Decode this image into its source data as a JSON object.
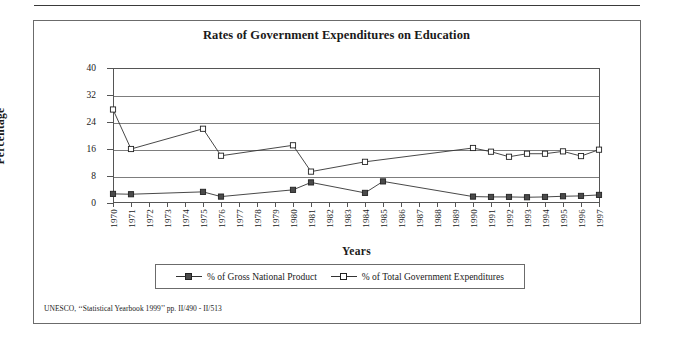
{
  "figure": {
    "title": "Rates of Government Expenditures on Education",
    "source_note": "UNESCO, ‘‘Statistical Yearbook 1999’’ pp. II/490 - II/513"
  },
  "legend": {
    "entries": [
      {
        "label": "% of Gross National Product",
        "marker": "filled-square",
        "color": "#4a4a4a"
      },
      {
        "label": "% of Total Government Expenditures",
        "marker": "open-square",
        "color": "#ffffff"
      }
    ]
  },
  "chart_data": {
    "type": "line",
    "title": "Rates of Government Expenditures on Education",
    "xlabel": "Years",
    "ylabel": "Percentage",
    "ylim": [
      0,
      40
    ],
    "yticks": [
      0,
      8,
      16,
      24,
      32,
      40
    ],
    "grid": true,
    "legend_position": "bottom",
    "categories": [
      "1970",
      "1971",
      "1972",
      "1973",
      "1974",
      "1975",
      "1976",
      "1977",
      "1978",
      "1979",
      "1980",
      "1981",
      "1982",
      "1983",
      "1984",
      "1985",
      "1986",
      "1987",
      "1988",
      "1989",
      "1990",
      "1991",
      "1992",
      "1993",
      "1994",
      "1995",
      "1996",
      "1997"
    ],
    "series": [
      {
        "name": "% of Gross National Product",
        "marker": "filled-square",
        "color": "#4a4a4a",
        "values": [
          2.7,
          2.6,
          null,
          null,
          null,
          3.3,
          1.9,
          null,
          null,
          null,
          3.9,
          6.1,
          null,
          null,
          3.0,
          6.4,
          null,
          null,
          null,
          null,
          1.9,
          1.8,
          1.8,
          1.7,
          1.8,
          2.0,
          2.1,
          2.4
        ]
      },
      {
        "name": "% of Total Government Expenditures",
        "marker": "open-square",
        "color": "#ffffff",
        "values": [
          27.7,
          16.0,
          null,
          null,
          null,
          22.0,
          14.0,
          null,
          null,
          null,
          17.1,
          9.3,
          null,
          null,
          12.2,
          null,
          null,
          null,
          null,
          null,
          16.3,
          15.2,
          13.7,
          14.6,
          14.6,
          15.3,
          13.9,
          15.8
        ]
      }
    ]
  }
}
